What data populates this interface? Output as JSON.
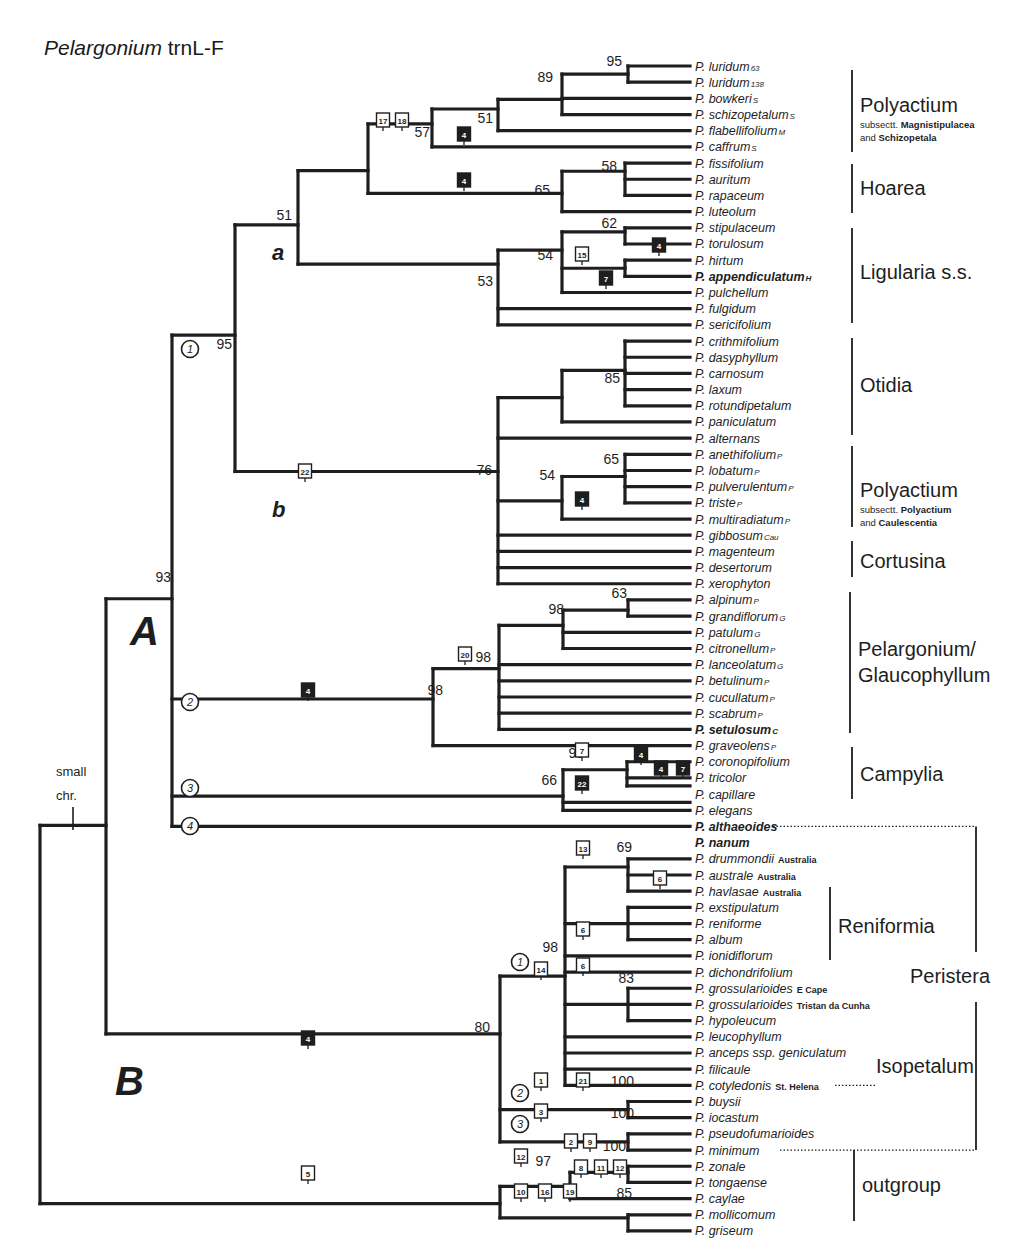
{
  "figure": {
    "title_italic": "Pelargonium",
    "title_rest": " trnL-F",
    "big_labels": [
      {
        "text": "A",
        "x": 130,
        "y": 645,
        "size": 40
      },
      {
        "text": "B",
        "x": 115,
        "y": 1095,
        "size": 40
      },
      {
        "text": "a",
        "x": 272,
        "y": 260,
        "size": 22
      },
      {
        "text": "b",
        "x": 272,
        "y": 517,
        "size": 22
      }
    ],
    "small_chr": {
      "line1": "small",
      "line2": "chr."
    }
  },
  "taxa": [
    {
      "name": "P. luridum",
      "sfx": "63"
    },
    {
      "name": "P. luridum",
      "sfx": "138"
    },
    {
      "name": "P. bowkeri",
      "sfx": "S"
    },
    {
      "name": "P. schizopetalum",
      "sfx": "S"
    },
    {
      "name": "P. flabellifolium",
      "sfx": "M"
    },
    {
      "name": "P. caffrum",
      "sfx": "S"
    },
    {
      "name": "P. fissifolium",
      "sfx": ""
    },
    {
      "name": "P. auritum",
      "sfx": ""
    },
    {
      "name": "P. rapaceum",
      "sfx": ""
    },
    {
      "name": "P. luteolum",
      "sfx": ""
    },
    {
      "name": "P. stipulaceum",
      "sfx": ""
    },
    {
      "name": "P. torulosum",
      "sfx": ""
    },
    {
      "name": "P. hirtum",
      "sfx": ""
    },
    {
      "name": "P. appendiculatum",
      "sfx": "H",
      "bold": true
    },
    {
      "name": "P. pulchellum",
      "sfx": ""
    },
    {
      "name": "P. fulgidum",
      "sfx": ""
    },
    {
      "name": "P. sericifolium",
      "sfx": ""
    },
    {
      "name": "P. crithmifolium",
      "sfx": ""
    },
    {
      "name": "P. dasyphyllum",
      "sfx": ""
    },
    {
      "name": "P. carnosum",
      "sfx": ""
    },
    {
      "name": "P. laxum",
      "sfx": ""
    },
    {
      "name": "P. rotundipetalum",
      "sfx": ""
    },
    {
      "name": "P. paniculatum",
      "sfx": ""
    },
    {
      "name": "P. alternans",
      "sfx": ""
    },
    {
      "name": "P. anethifolium",
      "sfx": "P"
    },
    {
      "name": "P. lobatum",
      "sfx": "P"
    },
    {
      "name": "P. pulverulentum",
      "sfx": "P"
    },
    {
      "name": "P. triste",
      "sfx": "P"
    },
    {
      "name": "P. multiradiatum",
      "sfx": "P"
    },
    {
      "name": "P. gibbosum",
      "sfx": "Cau"
    },
    {
      "name": "P. magenteum",
      "sfx": ""
    },
    {
      "name": "P. desertorum",
      "sfx": ""
    },
    {
      "name": "P. xerophyton",
      "sfx": ""
    },
    {
      "name": "P. alpinum",
      "sfx": "P"
    },
    {
      "name": "P. grandiflorum",
      "sfx": "G"
    },
    {
      "name": "P. patulum",
      "sfx": "G"
    },
    {
      "name": "P. citronellum",
      "sfx": "P"
    },
    {
      "name": "P. lanceolatum",
      "sfx": "G"
    },
    {
      "name": "P. betulinum",
      "sfx": "P"
    },
    {
      "name": "P. cucullatum",
      "sfx": "P"
    },
    {
      "name": "P. scabrum",
      "sfx": "P"
    },
    {
      "name": "P. setulosum",
      "sfx": "C",
      "bold": true
    },
    {
      "name": "P. graveolens",
      "sfx": "P"
    },
    {
      "name": "P. coronopifolium",
      "sfx": ""
    },
    {
      "name": "P. tricolor",
      "sfx": ""
    },
    {
      "name": "P. capillare",
      "sfx": ""
    },
    {
      "name": "P. elegans",
      "sfx": ""
    },
    {
      "name": "P. althaeoides",
      "sfx": "",
      "bold": true
    },
    {
      "name": "P. nanum",
      "sfx": "",
      "bold": true
    },
    {
      "name": "P. drummondii",
      "loc": "Australia"
    },
    {
      "name": "P. australe",
      "loc": "Australia"
    },
    {
      "name": "P. havlasae",
      "loc": "Australia"
    },
    {
      "name": "P. exstipulatum",
      "sfx": ""
    },
    {
      "name": "P. reniforme",
      "sfx": ""
    },
    {
      "name": "P. album",
      "sfx": ""
    },
    {
      "name": "P. ionidiflorum",
      "sfx": ""
    },
    {
      "name": "P. dichondrifolium",
      "sfx": ""
    },
    {
      "name": "P. grossularioides",
      "loc": "E Cape"
    },
    {
      "name": "P. grossularioides",
      "loc": "Tristan da Cunha"
    },
    {
      "name": "P. hypoleucum",
      "sfx": ""
    },
    {
      "name": "P. leucophyllum",
      "sfx": ""
    },
    {
      "name": "P. anceps ssp. geniculatum",
      "sfx": ""
    },
    {
      "name": "P. filicaule",
      "sfx": ""
    },
    {
      "name": "P. cotyledonis",
      "loc": "St. Helena"
    },
    {
      "name": "P. buysii",
      "sfx": ""
    },
    {
      "name": "P. iocastum",
      "sfx": ""
    },
    {
      "name": "P. pseudofumarioides",
      "sfx": ""
    },
    {
      "name": "P. minimum",
      "sfx": ""
    },
    {
      "name": "P. zonale",
      "sfx": ""
    },
    {
      "name": "P. tongaense",
      "sfx": ""
    },
    {
      "name": "P. caylae",
      "sfx": ""
    },
    {
      "name": "P. mollicomum",
      "sfx": ""
    },
    {
      "name": "P. griseum",
      "sfx": ""
    }
  ],
  "support_values": [
    {
      "v": "95",
      "x": 622,
      "y": 66
    },
    {
      "v": "89",
      "x": 553,
      "y": 82
    },
    {
      "v": "51",
      "x": 493,
      "y": 123
    },
    {
      "v": "57",
      "x": 430,
      "y": 137
    },
    {
      "v": "51",
      "x": 292,
      "y": 220
    },
    {
      "v": "58",
      "x": 617,
      "y": 171
    },
    {
      "v": "65",
      "x": 550,
      "y": 195
    },
    {
      "v": "62",
      "x": 617,
      "y": 228
    },
    {
      "v": "54",
      "x": 553,
      "y": 260
    },
    {
      "v": "53",
      "x": 493,
      "y": 286
    },
    {
      "v": "95",
      "x": 232,
      "y": 349
    },
    {
      "v": "85",
      "x": 620,
      "y": 383
    },
    {
      "v": "65",
      "x": 619,
      "y": 464
    },
    {
      "v": "54",
      "x": 555,
      "y": 480
    },
    {
      "v": "76",
      "x": 492,
      "y": 475
    },
    {
      "v": "93",
      "x": 171,
      "y": 582
    },
    {
      "v": "63",
      "x": 627,
      "y": 598
    },
    {
      "v": "98",
      "x": 564,
      "y": 614
    },
    {
      "v": "98",
      "x": 491,
      "y": 662
    },
    {
      "v": "98",
      "x": 443,
      "y": 695
    },
    {
      "v": "98",
      "x": 584,
      "y": 758
    },
    {
      "v": "66",
      "x": 557,
      "y": 785
    },
    {
      "v": "69",
      "x": 632,
      "y": 852
    },
    {
      "v": "98",
      "x": 558,
      "y": 952
    },
    {
      "v": "83",
      "x": 634,
      "y": 983
    },
    {
      "v": "80",
      "x": 490,
      "y": 1032
    },
    {
      "v": "100",
      "x": 634,
      "y": 1086
    },
    {
      "v": "100",
      "x": 634,
      "y": 1118
    },
    {
      "v": "97",
      "x": 551,
      "y": 1166
    },
    {
      "v": "100",
      "x": 626,
      "y": 1151
    },
    {
      "v": "85",
      "x": 632,
      "y": 1198
    }
  ],
  "markers": [
    {
      "n": "17",
      "t": "open",
      "x": 383,
      "y": 121
    },
    {
      "n": "18",
      "t": "open",
      "x": 402,
      "y": 121
    },
    {
      "n": "4",
      "t": "filled",
      "x": 464,
      "y": 135
    },
    {
      "n": "4",
      "t": "filled",
      "x": 464,
      "y": 181
    },
    {
      "n": "4",
      "t": "filled",
      "x": 659,
      "y": 246
    },
    {
      "n": "15",
      "t": "open",
      "x": 582,
      "y": 255
    },
    {
      "n": "7",
      "t": "filled",
      "x": 606,
      "y": 279
    },
    {
      "n": "22",
      "t": "open",
      "x": 305,
      "y": 472
    },
    {
      "n": "4",
      "t": "filled",
      "x": 582,
      "y": 500
    },
    {
      "n": "4",
      "t": "filled",
      "x": 308,
      "y": 691
    },
    {
      "n": "20",
      "t": "open",
      "x": 465,
      "y": 655
    },
    {
      "n": "7",
      "t": "open",
      "x": 582,
      "y": 751
    },
    {
      "n": "22",
      "t": "filled",
      "x": 582,
      "y": 784
    },
    {
      "n": "4",
      "t": "filled",
      "x": 641,
      "y": 755
    },
    {
      "n": "4",
      "t": "filled",
      "x": 661,
      "y": 769
    },
    {
      "n": "7",
      "t": "filled",
      "x": 683,
      "y": 769
    },
    {
      "n": "13",
      "t": "open",
      "x": 583,
      "y": 849
    },
    {
      "n": "6",
      "t": "open",
      "x": 660,
      "y": 879
    },
    {
      "n": "6",
      "t": "open",
      "x": 583,
      "y": 930
    },
    {
      "n": "6",
      "t": "open",
      "x": 583,
      "y": 966
    },
    {
      "n": "14",
      "t": "open",
      "x": 541,
      "y": 970
    },
    {
      "n": "1",
      "t": "open",
      "x": 541,
      "y": 1081
    },
    {
      "n": "21",
      "t": "open",
      "x": 583,
      "y": 1081
    },
    {
      "n": "3",
      "t": "open",
      "x": 541,
      "y": 1112
    },
    {
      "n": "4",
      "t": "filled",
      "x": 308,
      "y": 1039
    },
    {
      "n": "2",
      "t": "open",
      "x": 571,
      "y": 1142
    },
    {
      "n": "9",
      "t": "open",
      "x": 590,
      "y": 1142
    },
    {
      "n": "8",
      "t": "open",
      "x": 581,
      "y": 1168
    },
    {
      "n": "11",
      "t": "open",
      "x": 601,
      "y": 1168
    },
    {
      "n": "12",
      "t": "open",
      "x": 620,
      "y": 1168
    },
    {
      "n": "12",
      "t": "open",
      "x": 521,
      "y": 1157
    },
    {
      "n": "10",
      "t": "open",
      "x": 521,
      "y": 1192
    },
    {
      "n": "16",
      "t": "open",
      "x": 545,
      "y": 1192
    },
    {
      "n": "19",
      "t": "open",
      "x": 570,
      "y": 1192
    },
    {
      "n": "5",
      "t": "open",
      "x": 308,
      "y": 1174
    }
  ],
  "circled": [
    {
      "n": "1",
      "x": 190,
      "y": 349
    },
    {
      "n": "2",
      "x": 190,
      "y": 702
    },
    {
      "n": "3",
      "x": 190,
      "y": 788
    },
    {
      "n": "4",
      "x": 190,
      "y": 826
    },
    {
      "n": "1",
      "x": 520,
      "y": 962
    },
    {
      "n": "2",
      "x": 520,
      "y": 1093
    },
    {
      "n": "3",
      "x": 520,
      "y": 1124
    }
  ],
  "clades": [
    {
      "name": "Polyactium",
      "sub1_pre": "subsectt. ",
      "sub1_b": "Magnistipulacea",
      "sub2_pre": "and ",
      "sub2_b": "Schizopetala",
      "bar_y1": 70,
      "bar_y2": 152,
      "x": 862,
      "y": 112
    },
    {
      "name": "Hoarea",
      "bar_y1": 164,
      "bar_y2": 213,
      "x": 862,
      "y": 195
    },
    {
      "name": "Ligularia s.s.",
      "bar_y1": 228,
      "bar_y2": 323,
      "x": 862,
      "y": 279
    },
    {
      "name": "Otidia",
      "bar_y1": 338,
      "bar_y2": 435,
      "x": 862,
      "y": 392
    },
    {
      "name": "Polyactium",
      "sub1_pre": "subsectt. ",
      "sub1_b": "Polyactium",
      "sub2_pre": "and ",
      "sub2_b": "Caulescentia",
      "bar_y1": 446,
      "bar_y2": 527,
      "x": 862,
      "y": 497
    },
    {
      "name": "Cortusina",
      "bar_y1": 541,
      "bar_y2": 577,
      "x": 862,
      "y": 568
    },
    {
      "name": "Pelargonium/",
      "name2": "Glaucophyllum",
      "bar_y1": 592,
      "bar_y2": 733,
      "x": 860,
      "y": 656
    },
    {
      "name": "Campylia",
      "bar_y1": 747,
      "bar_y2": 799,
      "x": 862,
      "y": 781
    },
    {
      "name": "Reniformia",
      "bar_y1": 887,
      "bar_y2": 960,
      "x": 840,
      "y": 933
    },
    {
      "name": "Peristera",
      "bar_y1": 0,
      "bar_y2": 0,
      "x": 912,
      "y": 983
    },
    {
      "name": "Isopetalum",
      "bar_y1": 0,
      "bar_y2": 0,
      "x": 878,
      "y": 1073
    },
    {
      "name": "outgroup",
      "bar_y1": 1150,
      "bar_y2": 1221,
      "x": 864,
      "y": 1192
    }
  ]
}
